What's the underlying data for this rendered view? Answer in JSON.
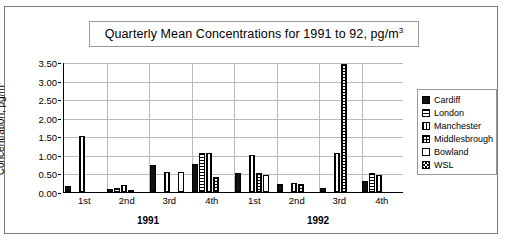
{
  "chart": {
    "title_main": "Quarterly Mean Concentrations for 1991 to 92, pg/m",
    "title_sup": "3",
    "y_axis_title_main": "Concentration, pg/m",
    "y_axis_title_sup": "3"
  },
  "legend": {
    "items": [
      {
        "label": "Cardiff",
        "pattern": "solid-black"
      },
      {
        "label": "London",
        "pattern": "horizontal-lines"
      },
      {
        "label": "Manchester",
        "pattern": "vertical-lines"
      },
      {
        "label": "Middlesbrough",
        "pattern": "cross-hatch"
      },
      {
        "label": "Bowland",
        "pattern": "empty-white"
      },
      {
        "label": "WSL",
        "pattern": "dense-diagonal-hatch"
      }
    ]
  },
  "chart_data": {
    "type": "bar",
    "title": "Quarterly Mean Concentrations for 1991 to 92, pg/m3",
    "xlabel": "",
    "ylabel": "Concentration, pg/m3",
    "ylim": [
      0,
      3.5
    ],
    "yticks": [
      "0.00",
      "0.50",
      "1.00",
      "1.50",
      "2.00",
      "2.50",
      "3.00",
      "3.50"
    ],
    "ytick_values": [
      0,
      0.5,
      1.0,
      1.5,
      2.0,
      2.5,
      3.0,
      3.5
    ],
    "grid": true,
    "legend_position": "right",
    "categories": [
      "1st",
      "2nd",
      "3rd",
      "4th",
      "1st",
      "2nd",
      "3rd",
      "4th"
    ],
    "group_labels": [
      "1991",
      "1992"
    ],
    "group_spans": [
      4,
      4
    ],
    "series": [
      {
        "name": "Cardiff",
        "values": [
          0.15,
          0.08,
          0.72,
          0.75,
          0.5,
          0.22,
          0.1,
          0.3
        ]
      },
      {
        "name": "London",
        "values": [
          0.0,
          0.1,
          0.0,
          1.05,
          0.0,
          0.0,
          0.0,
          0.5
        ]
      },
      {
        "name": "Manchester",
        "values": [
          1.5,
          0.18,
          0.55,
          1.05,
          1.0,
          0.25,
          1.05,
          0.45
        ]
      },
      {
        "name": "Middlesbrough",
        "values": [
          0.0,
          0.05,
          0.0,
          0.4,
          0.5,
          0.22,
          3.45,
          0.0
        ]
      },
      {
        "name": "Bowland",
        "values": [
          0.0,
          0.0,
          0.55,
          0.0,
          0.45,
          0.0,
          0.0,
          0.0
        ]
      },
      {
        "name": "WSL",
        "values": [
          0.0,
          0.0,
          0.0,
          0.0,
          0.0,
          0.0,
          0.0,
          0.0
        ]
      }
    ]
  }
}
